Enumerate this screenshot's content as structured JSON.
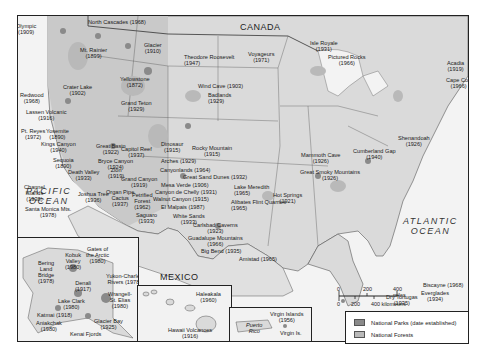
{
  "map": {
    "countries": {
      "canada": "CANADA",
      "mexico": "MEXICO"
    },
    "oceans": {
      "pacific": [
        "PACIFIC",
        "OCEAN"
      ],
      "atlantic": [
        "ATLANTIC",
        "OCEAN"
      ]
    },
    "parks": [
      {
        "name": "Olympic",
        "year": "(1909)"
      },
      {
        "name": "North Cascades",
        "year": "(1968)"
      },
      {
        "name": "Mt. Rainier",
        "year": "(1899)"
      },
      {
        "name": "Glacier",
        "year": "(1910)"
      },
      {
        "name": "Crater Lake",
        "year": "(1902)"
      },
      {
        "name": "Redwood",
        "year": "(1968)"
      },
      {
        "name": "Lassen Volcanic",
        "year": "(1916)"
      },
      {
        "name": "Yellowstone",
        "year": "(1872)"
      },
      {
        "name": "Grand Teton",
        "year": "(1929)"
      },
      {
        "name": "Theodore Roosevelt",
        "year": "(1947)"
      },
      {
        "name": "Wind Cave",
        "year": "(1903)"
      },
      {
        "name": "Badlands",
        "year": "(1929)"
      },
      {
        "name": "Voyageurs",
        "year": "(1971)"
      },
      {
        "name": "Isle Royale",
        "year": "(1931)"
      },
      {
        "name": "Pictured Rocks",
        "year": "(1966)"
      },
      {
        "name": "Acadia",
        "year": "(1919)"
      },
      {
        "name": "Cape Cod",
        "year": "(1966)"
      },
      {
        "name": "Pt. Reyes",
        "year": "(1972)"
      },
      {
        "name": "Yosemite",
        "year": "(1890)"
      },
      {
        "name": "Kings Canyon",
        "year": "(1940)"
      },
      {
        "name": "Sequoia",
        "year": "(1890)"
      },
      {
        "name": "Death Valley",
        "year": "(1933)"
      },
      {
        "name": "Channel Islands",
        "year": "(1938)"
      },
      {
        "name": "Santa Monica Mts.",
        "year": "(1978)"
      },
      {
        "name": "Joshua Tree",
        "year": "(1936)"
      },
      {
        "name": "Great Basin",
        "year": "(1922)"
      },
      {
        "name": "Bryce Canyon",
        "year": "(1924)"
      },
      {
        "name": "Zion",
        "year": "(1919)"
      },
      {
        "name": "Capitol Reef",
        "year": "(1937)"
      },
      {
        "name": "Grand Canyon",
        "year": "(1919)"
      },
      {
        "name": "Organ Pipe Cactus",
        "year": "(1937)"
      },
      {
        "name": "Petrified Forest",
        "year": "(1962)"
      },
      {
        "name": "Saguaro",
        "year": "(1933)"
      },
      {
        "name": "Dinosaur",
        "year": "(1915)"
      },
      {
        "name": "Arches",
        "year": "(1929)"
      },
      {
        "name": "Canyonlands",
        "year": "(1964)"
      },
      {
        "name": "Rocky Mountain",
        "year": "(1915)"
      },
      {
        "name": "Great Sand Dunes",
        "year": "(1932)"
      },
      {
        "name": "Mesa Verde",
        "year": "(1906)"
      },
      {
        "name": "Canyon de Chelly",
        "year": "(1931)"
      },
      {
        "name": "Walnut Canyon",
        "year": "(1915)"
      },
      {
        "name": "El Malpais",
        "year": "(1987)"
      },
      {
        "name": "White Sands",
        "year": "(1933)"
      },
      {
        "name": "Carlsbad Caverns",
        "year": "(1923)"
      },
      {
        "name": "Guadalupe Mountains",
        "year": "(1966)"
      },
      {
        "name": "Big Bend",
        "year": "(1935)"
      },
      {
        "name": "Amistad",
        "year": "(1965)"
      },
      {
        "name": "Lake Meredith",
        "year": "(1965)"
      },
      {
        "name": "Alibates Flint Quarries",
        "year": "(1965)"
      },
      {
        "name": "Hot Springs",
        "year": "(1921)"
      },
      {
        "name": "Mammoth Cave",
        "year": "(1926)"
      },
      {
        "name": "Great Smoky Mountains",
        "year": "(1926)"
      },
      {
        "name": "Cumberland Gap",
        "year": "(1940)"
      },
      {
        "name": "Shenandoah",
        "year": "(1926)"
      },
      {
        "name": "Biscayne",
        "year": "(1968)"
      },
      {
        "name": "Everglades",
        "year": "(1934)"
      },
      {
        "name": "Dry Tortugas",
        "year": "(1935)"
      }
    ],
    "alaska": [
      {
        "name": "Kobuk Valley",
        "year": "(1980)"
      },
      {
        "name": "Gates of the Arctic",
        "year": "(1980)"
      },
      {
        "name": "Bering Land Bridge",
        "year": "(1978)"
      },
      {
        "name": "Yukon-Charley Rivers",
        "year": "(1978)"
      },
      {
        "name": "Denali",
        "year": "(1917)"
      },
      {
        "name": "Wrangell-St. Elias",
        "year": "(1980)"
      },
      {
        "name": "Lake Clark",
        "year": "(1980)"
      },
      {
        "name": "Katmai",
        "year": "(1918)"
      },
      {
        "name": "Aniakchak",
        "year": "(1980)"
      },
      {
        "name": "Glacier Bay",
        "year": "(1925)"
      },
      {
        "name": "Kenai Fjords",
        "year": "(1980)"
      }
    ],
    "hawaii": [
      {
        "name": "Haleakala",
        "year": "(1960)"
      },
      {
        "name": "Hawaii Volcanoes",
        "year": "(1916)"
      }
    ],
    "caribbean": {
      "virgin_islands": {
        "name": "Virgin Islands",
        "year": "(1956)"
      },
      "puerto_rico": [
        "Puerto",
        "Rico"
      ],
      "virgin_is": "Virgin Is."
    },
    "scale": {
      "miles": [
        "0",
        "200",
        "400 miles"
      ],
      "km": [
        "0",
        "200",
        "400 kilometers"
      ]
    },
    "legend": {
      "parks": "National Parks (date established)",
      "forests": "National Forests",
      "parks_color": "#8a8a8a",
      "forests_color": "#b9b9b9"
    }
  }
}
